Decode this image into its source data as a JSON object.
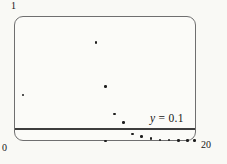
{
  "figure": {
    "y_max_label": "1",
    "origin_label": "0",
    "x_max_label": "20",
    "threshold_label_var": "y",
    "threshold_label_rest": " = 0.1"
  },
  "colors": {
    "paper": "#f9f9f5",
    "frame": "#6f6f6f",
    "reference_line": "#3d3d3d",
    "dot": "#1e1e1e",
    "text": "#161616"
  },
  "chart_data": {
    "type": "scatter",
    "title": "",
    "xlabel": "",
    "ylabel": "",
    "xlim": [
      0,
      20
    ],
    "ylim": [
      0,
      1
    ],
    "x_tick_labels": [
      "0",
      "20"
    ],
    "y_tick_labels": [
      "0",
      "1"
    ],
    "grid": false,
    "legend": null,
    "frame": "rounded viewing window, axes implied by frame edges",
    "points": [
      {
        "x": 1,
        "y": 0.37
      },
      {
        "x": 9,
        "y": 0.79
      },
      {
        "x": 10,
        "y": 0.44
      },
      {
        "x": 10,
        "y": 0.005
      },
      {
        "x": 11,
        "y": 0.22
      },
      {
        "x": 12,
        "y": 0.15
      },
      {
        "x": 13,
        "y": 0.06
      },
      {
        "x": 14,
        "y": 0.04
      },
      {
        "x": 15,
        "y": 0.025
      },
      {
        "x": 16,
        "y": 0.013
      },
      {
        "x": 17,
        "y": 0.012
      },
      {
        "x": 18,
        "y": 0.009
      },
      {
        "x": 19,
        "y": 0.008
      },
      {
        "x": 19.8,
        "y": 0.008
      }
    ],
    "reference_line": {
      "y": 0.1,
      "label": "y = 0.1"
    }
  }
}
